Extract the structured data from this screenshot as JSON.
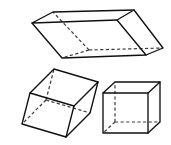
{
  "figure": {
    "title": "Oblique and right prisms",
    "background_color": "#ffffff",
    "line_color": "#101010",
    "hidden_line_color": "#3a3a3a",
    "canvas": {
      "width": 171,
      "height": 145
    },
    "shapes": [
      {
        "id": "top-oblique-prism",
        "name": "oblique-rectangular-prism-top",
        "label": "Oblique rectangular prism (wide, viewed from above)",
        "position": "top-center",
        "hidden_edges": 3,
        "vertices": {
          "front_bottom_left": [
            62,
            58
          ],
          "front_bottom_right": [
            146,
            55
          ],
          "front_top_left": [
            32,
            23
          ],
          "front_top_right": [
            117,
            20
          ],
          "back_bottom_left": [
            89,
            50
          ],
          "back_bottom_right": [
            163,
            48
          ],
          "back_top_left": [
            53,
            12
          ],
          "back_top_right": [
            134,
            10
          ]
        }
      },
      {
        "id": "bottom-left-oblique-prism",
        "name": "oblique-rectangular-prism-left",
        "label": "Oblique rectangular prism (leaning, lower left)",
        "position": "bottom-left",
        "hidden_edges": 3,
        "vertices": {
          "front_bottom_left": [
            22,
            124
          ],
          "front_bottom_right": [
            66,
            137
          ],
          "front_top_left": [
            30,
            93
          ],
          "front_top_right": [
            74,
            106
          ],
          "back_bottom_left": [
            46,
            100
          ],
          "back_bottom_right": [
            90,
            113
          ],
          "back_top_left": [
            54,
            69
          ],
          "back_top_right": [
            98,
            82
          ]
        }
      },
      {
        "id": "bottom-right-cube",
        "name": "right-rectangular-prism-cube",
        "label": "Cube / right rectangular prism",
        "position": "bottom-right",
        "hidden_edges": 3,
        "vertices": {
          "front_bottom_left": [
            103,
            133
          ],
          "front_bottom_right": [
            148,
            133
          ],
          "front_top_left": [
            103,
            93
          ],
          "front_top_right": [
            148,
            93
          ],
          "back_bottom_left": [
            115,
            122
          ],
          "back_bottom_right": [
            160,
            122
          ],
          "back_top_left": [
            115,
            82
          ],
          "back_top_right": [
            160,
            82
          ]
        }
      }
    ]
  }
}
